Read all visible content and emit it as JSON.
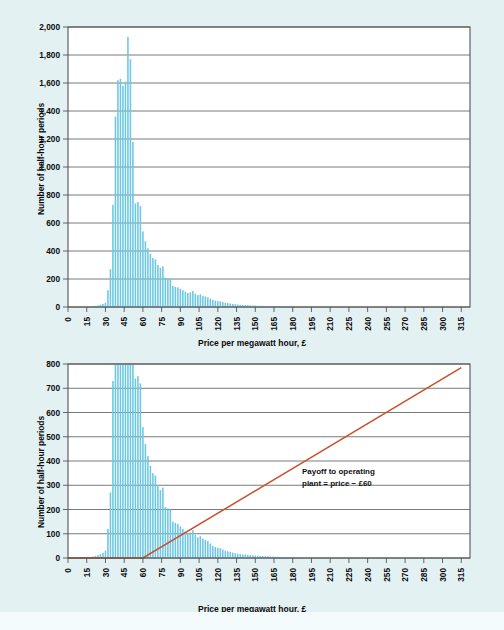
{
  "figure": {
    "background_color": "#e4f1f3",
    "bar_color": "#6cc7e4",
    "line_color": "#c8502a",
    "grid_color": "#6b6b6b",
    "axis_color": "#555555",
    "text_color": "#0b0b0b"
  },
  "charts": [
    {
      "id": "top",
      "ylabel": "Number of half-hour periods",
      "xlabel": "Price per megawatt hour, £",
      "y_ticks": [
        "0",
        "200",
        "400",
        "600",
        "800",
        "1,000",
        "1,200",
        "1,400",
        "1,600",
        "1,800",
        "2,000"
      ],
      "x_ticks": [
        "0",
        "15",
        "30",
        "45",
        "60",
        "75",
        "90",
        "105",
        "120",
        "135",
        "150",
        "165",
        "180",
        "195",
        "210",
        "225",
        "240",
        "255",
        "270",
        "285",
        "300",
        "315"
      ]
    },
    {
      "id": "bottom",
      "ylabel": "Number of half-hour periods",
      "xlabel": "Price per megawatt hour, £",
      "annotation_line1": "Payoff to operating",
      "annotation_line2": "plant = price − £60",
      "y_ticks": [
        "0",
        "100",
        "200",
        "300",
        "400",
        "500",
        "600",
        "700",
        "800"
      ],
      "x_ticks": [
        "0",
        "15",
        "30",
        "45",
        "60",
        "75",
        "90",
        "105",
        "120",
        "135",
        "150",
        "165",
        "180",
        "195",
        "210",
        "225",
        "240",
        "255",
        "270",
        "285",
        "300",
        "315"
      ]
    }
  ],
  "chart_data": [
    {
      "type": "bar",
      "id": "price-histogram",
      "title": "",
      "xlabel": "Price per megawatt hour, £",
      "ylabel": "Number of half-hour periods",
      "xlim": [
        0,
        322
      ],
      "ylim": [
        0,
        2000
      ],
      "grid": true,
      "legend": "none",
      "bar_color": "#6cc7e4",
      "bin_width": 2,
      "x": [
        18,
        20,
        22,
        24,
        26,
        28,
        30,
        32,
        34,
        36,
        38,
        40,
        42,
        44,
        46,
        48,
        50,
        52,
        54,
        56,
        58,
        60,
        62,
        64,
        66,
        68,
        70,
        72,
        74,
        76,
        78,
        80,
        82,
        84,
        86,
        88,
        90,
        92,
        94,
        96,
        98,
        100,
        102,
        104,
        106,
        108,
        110,
        112,
        114,
        116,
        118,
        120,
        122,
        124,
        126,
        128,
        130,
        132,
        134,
        136,
        138,
        140,
        142,
        144,
        146,
        148,
        150,
        152,
        154,
        156,
        158,
        160,
        162,
        164,
        166,
        168,
        170,
        172,
        174,
        176,
        178,
        180
      ],
      "values": [
        4,
        6,
        8,
        12,
        16,
        22,
        30,
        120,
        270,
        730,
        1360,
        1620,
        1630,
        1580,
        1610,
        1930,
        1770,
        1180,
        740,
        750,
        720,
        540,
        470,
        420,
        380,
        350,
        340,
        300,
        280,
        290,
        210,
        205,
        200,
        150,
        145,
        140,
        130,
        120,
        110,
        100,
        105,
        115,
        95,
        85,
        90,
        80,
        75,
        70,
        60,
        50,
        45,
        42,
        40,
        35,
        30,
        28,
        25,
        22,
        20,
        18,
        16,
        15,
        14,
        13,
        12,
        11,
        10,
        9,
        8,
        8,
        7,
        7,
        6,
        6,
        5,
        5,
        4,
        4,
        3,
        3,
        2,
        2
      ]
    },
    {
      "type": "bar",
      "id": "price-histogram-with-payoff",
      "title": "",
      "xlabel": "Price per megawatt hour, £",
      "ylabel": "Number of half-hour periods",
      "xlim": [
        0,
        322
      ],
      "ylim": [
        0,
        800
      ],
      "grid": true,
      "legend": "none",
      "bar_color": "#6cc7e4",
      "bin_width": 2,
      "note": "Same histogram as the upper panel but on a 0-800 scale, so bars below ~60 are clipped at the top of the axis.",
      "x": [
        18,
        20,
        22,
        24,
        26,
        28,
        30,
        32,
        34,
        36,
        38,
        40,
        42,
        44,
        46,
        48,
        50,
        52,
        54,
        56,
        58,
        60,
        62,
        64,
        66,
        68,
        70,
        72,
        74,
        76,
        78,
        80,
        82,
        84,
        86,
        88,
        90,
        92,
        94,
        96,
        98,
        100,
        102,
        104,
        106,
        108,
        110,
        112,
        114,
        116,
        118,
        120,
        122,
        124,
        126,
        128,
        130,
        132,
        134,
        136,
        138,
        140,
        142,
        144,
        146,
        148,
        150,
        152,
        154,
        156,
        158,
        160,
        162,
        164,
        166,
        168,
        170,
        172,
        174,
        176,
        178,
        180
      ],
      "values": [
        4,
        6,
        8,
        12,
        16,
        22,
        30,
        120,
        270,
        730,
        1360,
        1620,
        1630,
        1580,
        1610,
        1930,
        1770,
        1180,
        740,
        750,
        720,
        540,
        470,
        420,
        380,
        350,
        340,
        300,
        280,
        290,
        210,
        205,
        200,
        150,
        145,
        140,
        130,
        120,
        110,
        100,
        105,
        115,
        95,
        85,
        90,
        80,
        75,
        70,
        60,
        50,
        45,
        42,
        40,
        35,
        30,
        28,
        25,
        22,
        20,
        18,
        16,
        15,
        14,
        13,
        12,
        11,
        10,
        9,
        8,
        8,
        7,
        7,
        6,
        6,
        5,
        5,
        4,
        4,
        3,
        3,
        2,
        2
      ],
      "overlay_series": {
        "name": "Payoff to operating plant = price − £60",
        "type": "line",
        "color": "#c8502a",
        "x": [
          0,
          60,
          315
        ],
        "y": [
          0,
          0,
          785
        ],
        "annotation": "Payoff to operating plant = price − £60",
        "strike": 60
      }
    }
  ]
}
